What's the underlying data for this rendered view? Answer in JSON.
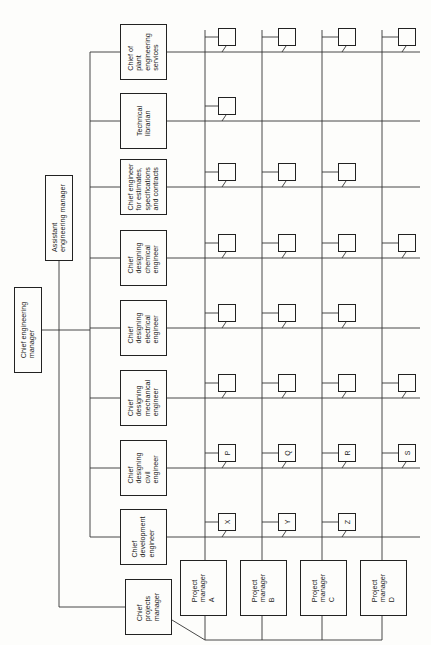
{
  "top": {
    "chief_engineering_manager": "Chief engineering\nmanager",
    "assistant_engineering_manager": "Assistant\nengineering manager"
  },
  "departments": [
    {
      "label": "Chief of\nplant\nengineering\nservices"
    },
    {
      "label": "Technical\nlibrarian"
    },
    {
      "label": "Chief engineer\nfor estimates,\nspecifications\nand contracts"
    },
    {
      "label": "Chief\ndesigning\nchemical\nengineer"
    },
    {
      "label": "Chief\ndesigning\nelectrical\nengineer"
    },
    {
      "label": "Chief\ndesigning\nmechanical\nengineer"
    },
    {
      "label": "Chief\ndesigning\ncivil\nengineer"
    },
    {
      "label": "Chief\ndevelopment\nengineer"
    }
  ],
  "projects": {
    "chief_projects_manager": "Chief\nprojects\nmanager",
    "managers": [
      {
        "label": "Project\nmanager\nA"
      },
      {
        "label": "Project\nmanager\nB"
      },
      {
        "label": "Project\nmanager\nC"
      },
      {
        "label": "Project\nmanager\nD"
      }
    ]
  },
  "assignments": {
    "description": "Rows = departments (top to bottom), columns = project managers A-D; value = small box label or empty; null = no box",
    "grid": [
      [
        "",
        "",
        "",
        ""
      ],
      [
        "",
        null,
        null,
        null
      ],
      [
        "",
        "",
        "",
        null
      ],
      [
        "",
        "",
        "",
        ""
      ],
      [
        "",
        "",
        "",
        null
      ],
      [
        "",
        "",
        "",
        ""
      ],
      [
        "P",
        "Q",
        "R",
        "S"
      ],
      [
        "X",
        "Y",
        "Z",
        null
      ]
    ]
  }
}
